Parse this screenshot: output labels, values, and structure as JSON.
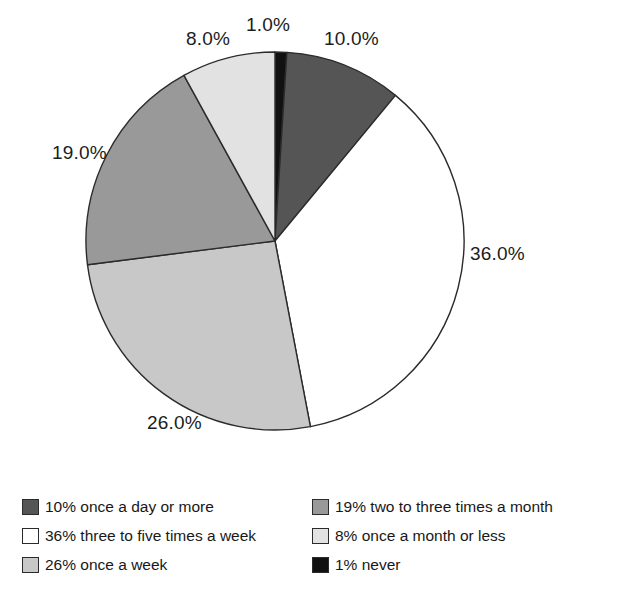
{
  "chart_data": {
    "type": "pie",
    "title": "",
    "subtitle": "",
    "xlabel": "",
    "ylabel": "",
    "legend_position": "bottom",
    "grid": false,
    "start_angle_deg": 0,
    "direction": "clockwise",
    "categories": [
      "never",
      "once a day or more",
      "three to five times a week",
      "once a week",
      "two to three times a month",
      "once a month or less"
    ],
    "values": [
      1,
      10,
      36,
      26,
      19,
      8
    ],
    "data_labels": [
      "1.0%",
      "10.0%",
      "36.0%",
      "26.0%",
      "19.0%",
      "8.0%"
    ],
    "colors": [
      "#111111",
      "#555555",
      "#ffffff",
      "#c8c8c8",
      "#999999",
      "#e2e2e2"
    ],
    "slices": [
      {
        "name": "never",
        "value": 1,
        "label": "1.0%",
        "color": "#111111",
        "start_deg": 0,
        "end_deg": 3.6
      },
      {
        "name": "once a day or more",
        "value": 10,
        "label": "10.0%",
        "color": "#555555",
        "start_deg": 3.6,
        "end_deg": 39.6
      },
      {
        "name": "three to five times a week",
        "value": 36,
        "label": "36.0%",
        "color": "#ffffff",
        "start_deg": 39.6,
        "end_deg": 169.2
      },
      {
        "name": "once a week",
        "value": 26,
        "label": "26.0%",
        "color": "#c8c8c8",
        "start_deg": 169.2,
        "end_deg": 262.8
      },
      {
        "name": "two to three times a month",
        "value": 19,
        "label": "19.0%",
        "color": "#999999",
        "start_deg": 262.8,
        "end_deg": 331.2
      },
      {
        "name": "once a month or less",
        "value": 8,
        "label": "8.0%",
        "color": "#e2e2e2",
        "start_deg": 331.2,
        "end_deg": 360
      }
    ]
  },
  "pie": {
    "labels": {
      "eight": "8.0%",
      "one": "1.0%",
      "ten": "10.0%",
      "thirtysix": "36.0%",
      "twentysix": "26.0%",
      "nineteen": "19.0%"
    }
  },
  "legend": {
    "left_column": [
      {
        "text": "10% once a day or more",
        "color": "#555555",
        "swatch": "swatch-dark-gray"
      },
      {
        "text": "36% three to five times a week",
        "color": "#ffffff",
        "swatch": "swatch-white"
      },
      {
        "text": "26% once a week",
        "color": "#c8c8c8",
        "swatch": "swatch-light-gray"
      }
    ],
    "right_column": [
      {
        "text": "19% two to three times a month",
        "color": "#999999",
        "swatch": "swatch-medium-gray"
      },
      {
        "text": "8% once a month or less",
        "color": "#e2e2e2",
        "swatch": "swatch-pale-gray"
      },
      {
        "text": "1% never",
        "color": "#111111",
        "swatch": "swatch-black"
      }
    ]
  }
}
